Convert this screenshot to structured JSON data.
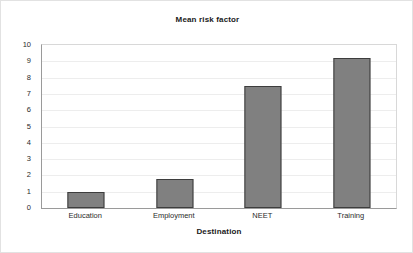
{
  "chart_data": {
    "type": "bar",
    "title": "Mean risk factor",
    "xlabel": "Destination",
    "ylabel": "",
    "categories": [
      "Education",
      "Employment",
      "NEET",
      "Training"
    ],
    "values": [
      1.0,
      1.75,
      7.5,
      9.2
    ],
    "ylim": [
      0,
      10
    ],
    "ytick_labels": [
      "10",
      "9",
      "8",
      "7",
      "6",
      "5",
      "4",
      "3",
      "2",
      "1",
      "0"
    ],
    "ytick_values": [
      10,
      9,
      8,
      7,
      6,
      5,
      4,
      3,
      2,
      1,
      0
    ],
    "grid": true,
    "legend": false,
    "bar_color": "#808080",
    "bar_border_color": "#3d3d3d",
    "plot_background": "#ffffff",
    "gridline_color": "#ededed",
    "axis_color": "#9a9a9a"
  }
}
